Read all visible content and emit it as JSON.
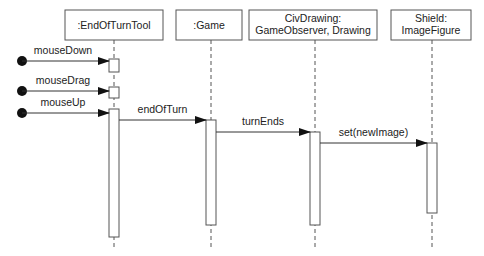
{
  "diagram": {
    "type": "UML sequence diagram",
    "lifelines": [
      {
        "id": "tool",
        "lines": [
          ":EndOfTurnTool"
        ],
        "x": 114,
        "box": [
          65,
          10,
          98,
          30
        ]
      },
      {
        "id": "game",
        "lines": [
          ":Game"
        ],
        "x": 211,
        "box": [
          176,
          10,
          66,
          30
        ]
      },
      {
        "id": "civ",
        "lines": [
          "CivDrawing:",
          "GameObserver, Drawing"
        ],
        "x": 315,
        "box": [
          249,
          10,
          128,
          30
        ]
      },
      {
        "id": "shield",
        "lines": [
          "Shield:",
          "ImageFigure"
        ],
        "x": 432,
        "box": [
          391,
          10,
          80,
          30
        ]
      }
    ],
    "found_messages": [
      {
        "label": "mouseDown",
        "y": 61
      },
      {
        "label": "mouseDrag",
        "y": 91
      },
      {
        "label": "mouseUp",
        "y": 113
      }
    ],
    "messages": [
      {
        "label": "endOfTurn",
        "from": "tool",
        "to": "game",
        "y": 120
      },
      {
        "label": "turnEnds",
        "from": "game",
        "to": "civ",
        "y": 132
      },
      {
        "label": "set(newImage)",
        "from": "civ",
        "to": "shield",
        "y": 143
      }
    ],
    "activations": [
      {
        "lifeline": "tool",
        "y1": 59,
        "y2": 72
      },
      {
        "lifeline": "tool",
        "y1": 87,
        "y2": 98
      },
      {
        "lifeline": "tool",
        "y1": 109,
        "y2": 237
      },
      {
        "lifeline": "game",
        "y1": 120,
        "y2": 225
      },
      {
        "lifeline": "civ",
        "y1": 132,
        "y2": 225
      },
      {
        "lifeline": "shield",
        "y1": 143,
        "y2": 213
      }
    ],
    "colors": {
      "line": "#333333",
      "box_border": "#555555",
      "background": "#ffffff"
    }
  }
}
